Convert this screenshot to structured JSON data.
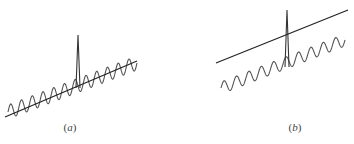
{
  "figure": {
    "panels": [
      {
        "id": "a",
        "label_open": "(",
        "label_letter": "a",
        "label_close": ")",
        "trend_line": {
          "x1": 5,
          "y1": 117,
          "x2": 137,
          "y2": 61
        },
        "wave": {
          "position": "on trend line",
          "x_start": 8,
          "x_end": 137,
          "y_start": 112,
          "y_end": 63,
          "cycles": 12,
          "amplitude": 7
        },
        "spike": {
          "x": 78,
          "base_y": 88,
          "peak_y": 35,
          "half_width": 2
        }
      },
      {
        "id": "b",
        "label_open": "(",
        "label_letter": "b",
        "label_close": ")",
        "trend_line": {
          "x1": 216,
          "y1": 63,
          "x2": 348,
          "y2": 10
        },
        "wave": {
          "position": "below trend line",
          "x_start": 221,
          "x_end": 345,
          "y_start": 88,
          "y_end": 40,
          "cycles": 10,
          "amplitude": 6
        },
        "spike": {
          "x": 287,
          "base_y": 67,
          "peak_y": 10,
          "half_width": 2
        }
      }
    ],
    "colors": {
      "trend_line": "#222222",
      "wave": "#555555",
      "spike": "#333333",
      "label": "#444444"
    }
  }
}
